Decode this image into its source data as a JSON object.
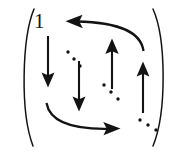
{
  "figure": {
    "kind": "matrix-arrow-diagram",
    "background_color": "#ffffff",
    "ink_color": "#131313",
    "width": 186,
    "height": 152,
    "labels": [
      {
        "name": "entry-label-one",
        "text": "1",
        "x": 34,
        "y": 11,
        "font_size": 21
      }
    ],
    "delimiters": [
      {
        "name": "left-paren",
        "side": "left",
        "glyph": "("
      },
      {
        "name": "right-paren",
        "side": "right",
        "glyph": ")"
      }
    ],
    "straight_arrows": [
      {
        "name": "arrow-down-left-outer",
        "direction": "down",
        "x": 48,
        "y1": 36,
        "y2": 86
      },
      {
        "name": "arrow-down-left-inner",
        "direction": "down",
        "x": 79,
        "y1": 60,
        "y2": 110
      },
      {
        "name": "arrow-up-right-inner",
        "direction": "up",
        "x": 112,
        "y1": 88,
        "y2": 40
      },
      {
        "name": "arrow-up-right-outer",
        "direction": "up",
        "x": 143,
        "y1": 112,
        "y2": 62
      }
    ],
    "curved_arrows": [
      {
        "name": "curved-arrow-top-left",
        "direction": "left",
        "from": [
          143,
          50
        ],
        "to": [
          66,
          22
        ]
      },
      {
        "name": "curved-arrow-bottom-right",
        "direction": "right",
        "from": [
          47,
          104
        ],
        "to": [
          119,
          128
        ]
      }
    ],
    "ellipsis_groups": [
      {
        "name": "ellipsis-upper-left",
        "orientation": "diagonal-down-right",
        "dots": [
          [
            68,
            52
          ],
          [
            74,
            59
          ],
          [
            80,
            66
          ]
        ]
      },
      {
        "name": "ellipsis-center-right",
        "orientation": "diagonal-down-right",
        "dots": [
          [
            104,
            85
          ],
          [
            111,
            92
          ],
          [
            118,
            99
          ]
        ]
      },
      {
        "name": "ellipsis-lower-right",
        "orientation": "diagonal-down-right",
        "dots": [
          [
            140,
            120
          ],
          [
            148,
            125
          ],
          [
            156,
            130
          ]
        ]
      }
    ]
  }
}
